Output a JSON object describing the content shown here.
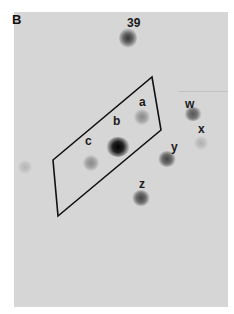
{
  "figure": {
    "panel_label": "B",
    "type": "2D gel autoradiograph",
    "region_outline": "parallelogram",
    "spots": [
      {
        "label": "39",
        "x": 128,
        "y": 38
      },
      {
        "label": "a",
        "x": 142,
        "y": 117
      },
      {
        "label": "b",
        "x": 118,
        "y": 147
      },
      {
        "label": "c",
        "x": 91,
        "y": 163
      },
      {
        "label": "w",
        "x": 193,
        "y": 114
      },
      {
        "label": "x",
        "x": 201,
        "y": 142
      },
      {
        "label": "y",
        "x": 167,
        "y": 159
      },
      {
        "label": "z",
        "x": 141,
        "y": 198
      }
    ],
    "labels": {
      "s39": "39",
      "a": "a",
      "b": "b",
      "c": "c",
      "w": "w",
      "x": "x",
      "y": "y",
      "z": "z"
    }
  }
}
